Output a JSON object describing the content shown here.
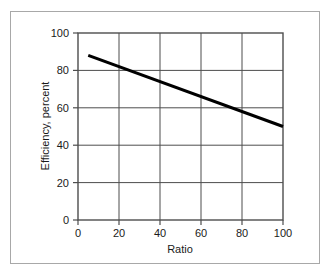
{
  "chart_data": {
    "type": "line",
    "title": "",
    "xlabel": "Ratio",
    "ylabel": "Efficiency, percent",
    "xlim": [
      0,
      100
    ],
    "ylim": [
      0,
      100
    ],
    "xticks": [
      0,
      20,
      40,
      60,
      80,
      100
    ],
    "yticks": [
      0,
      20,
      40,
      60,
      80,
      100
    ],
    "xtick_labels": [
      "0",
      "20",
      "40",
      "60",
      "80",
      "100"
    ],
    "ytick_labels": [
      "0",
      "20",
      "40",
      "60",
      "80",
      "100"
    ],
    "grid": true,
    "grid_axis": "both",
    "legend": false,
    "series": [
      {
        "name": "Efficiency vs Ratio",
        "color": "#000000",
        "line_width": 3,
        "x": [
          5,
          100
        ],
        "values": [
          88,
          50
        ]
      }
    ]
  },
  "colors": {
    "background": "#ffffff",
    "outer_border": "#a8a8a8",
    "axis": "#4d4d4d",
    "grid": "#4d4d4d",
    "line": "#000000",
    "text": "#1a1a1a"
  }
}
